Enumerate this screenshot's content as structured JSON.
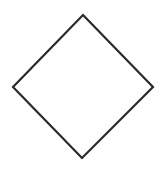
{
  "canvas": {
    "width": 168,
    "height": 170,
    "background": "#ffffff"
  },
  "shapes": [
    {
      "type": "diamond",
      "name": "diamond-shape",
      "points": [
        [
          83,
          15
        ],
        [
          153,
          87
        ],
        [
          82,
          158
        ],
        [
          13,
          87
        ]
      ],
      "stroke": "#2a2a2a",
      "stroke_width": 2.2,
      "fill": "#ffffff"
    }
  ]
}
